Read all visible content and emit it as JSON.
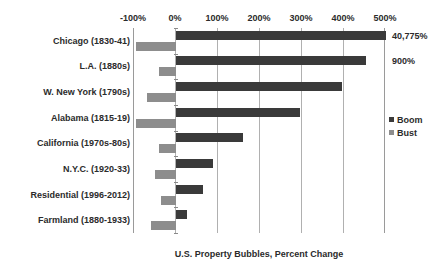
{
  "chart_data": {
    "type": "bar",
    "orientation": "horizontal",
    "title": "",
    "xlabel": "U.S. Property Bubbles, Percent Change",
    "ylabel": "",
    "xlim": [
      -100,
      500
    ],
    "xticks": [
      "-100%",
      "0%",
      "100%",
      "200%",
      "300%",
      "400%",
      "500%"
    ],
    "xtick_values": [
      -100,
      0,
      100,
      200,
      300,
      400,
      500
    ],
    "grid": true,
    "legend_position": "right",
    "categories": [
      "Chicago (1830-41)",
      "L.A. (1880s)",
      "W. New York (1790s)",
      "Alabama (1815-19)",
      "California (1970s-80s)",
      "N.Y.C. (1920-33)",
      "Residential (1996-2012)",
      "Farmland (1880-1933)"
    ],
    "series": [
      {
        "name": "Boom",
        "color": "#3a3a3a",
        "values": [
          500,
          453,
          396,
          295,
          160,
          87,
          64,
          26
        ]
      },
      {
        "name": "Bust",
        "color": "#8d8d8d",
        "values": [
          -95,
          -40,
          -70,
          -95,
          -40,
          -50,
          -35,
          -60
        ]
      }
    ],
    "annotations": [
      {
        "category": "Chicago (1830-41)",
        "series": "Boom",
        "label": "40,775%"
      },
      {
        "category": "L.A. (1880s)",
        "series": "Boom",
        "label": "900%"
      }
    ]
  },
  "legend": {
    "items": [
      {
        "label": "Boom",
        "color": "#3a3a3a"
      },
      {
        "label": "Bust",
        "color": "#8d8d8d"
      }
    ]
  }
}
